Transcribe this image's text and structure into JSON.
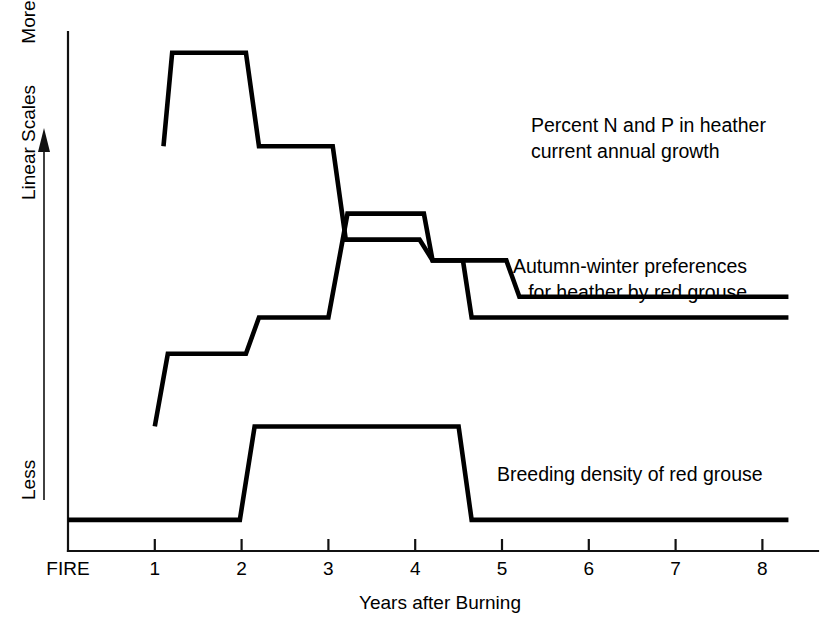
{
  "chart_data": {
    "type": "line",
    "title": "",
    "xlabel": "Years after Burning",
    "ylabel": "Linear Scales",
    "y_axis_top_label": "More",
    "y_axis_bottom_label": "Less",
    "y_axis_direction_note": "arrow pointing up",
    "grid": false,
    "legend_position": "inline-right-of-series",
    "xlim": [
      0,
      8.7
    ],
    "x_tick_labels": [
      "FIRE",
      "1",
      "2",
      "3",
      "4",
      "5",
      "6",
      "7",
      "8"
    ],
    "x_tick_values": [
      0,
      1,
      2,
      3,
      4,
      5,
      6,
      7,
      8
    ],
    "ylim": [
      0,
      100
    ],
    "y_tick_labels": [],
    "series": [
      {
        "name": "Percent N and P in heather current annual growth",
        "label_line1": "Percent N and P in heather",
        "label_line2": "current annual growth",
        "step_points": [
          {
            "x": 1.1,
            "y": 78
          },
          {
            "x": 1.2,
            "y": 96
          },
          {
            "x": 2.05,
            "y": 96
          },
          {
            "x": 2.2,
            "y": 78
          },
          {
            "x": 3.05,
            "y": 78
          },
          {
            "x": 3.2,
            "y": 60
          },
          {
            "x": 4.05,
            "y": 60
          },
          {
            "x": 4.2,
            "y": 56
          },
          {
            "x": 5.05,
            "y": 56
          },
          {
            "x": 5.2,
            "y": 49
          },
          {
            "x": 8.3,
            "y": 49
          }
        ]
      },
      {
        "name": "Autumn-winter preferences for heather by red grouse",
        "label_line1": "Autumn-winter preferences",
        "label_line2": "for heather by red grouse",
        "step_points": [
          {
            "x": 1.0,
            "y": 24
          },
          {
            "x": 1.15,
            "y": 38
          },
          {
            "x": 2.05,
            "y": 38
          },
          {
            "x": 2.2,
            "y": 45
          },
          {
            "x": 3.0,
            "y": 45
          },
          {
            "x": 3.22,
            "y": 65
          },
          {
            "x": 4.1,
            "y": 65
          },
          {
            "x": 4.2,
            "y": 56
          },
          {
            "x": 4.55,
            "y": 56
          },
          {
            "x": 4.65,
            "y": 45
          },
          {
            "x": 8.3,
            "y": 45
          }
        ]
      },
      {
        "name": "Breeding density of red grouse",
        "label_line1": "Breeding density of red grouse",
        "label_line2": "",
        "step_points": [
          {
            "x": 0.0,
            "y": 6
          },
          {
            "x": 1.98,
            "y": 6
          },
          {
            "x": 2.15,
            "y": 24
          },
          {
            "x": 4.5,
            "y": 24
          },
          {
            "x": 4.65,
            "y": 6
          },
          {
            "x": 8.3,
            "y": 6
          }
        ]
      }
    ]
  },
  "colors": {
    "line": "#000000",
    "axis": "#111111",
    "background": "#ffffff"
  }
}
